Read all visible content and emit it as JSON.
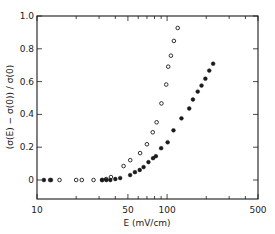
{
  "chart_data": {
    "type": "scatter",
    "title": "",
    "xlabel": "E (mV/cm)",
    "ylabel": "(σ(E) − σ(0)) / σ(0)",
    "xscale": "log",
    "xlim": [
      10,
      500
    ],
    "ylim": [
      -0.11,
      1.0
    ],
    "x_ticks": [
      10,
      50,
      100,
      500
    ],
    "x_tick_labels": [
      "10",
      "50",
      "100",
      "500"
    ],
    "y_ticks": [
      0,
      0.2,
      0.4,
      0.6,
      0.8,
      1.0
    ],
    "y_tick_labels": [
      "0",
      "0.2",
      "0.4",
      "0.6",
      "0.8",
      "1.0"
    ],
    "grid": false,
    "legend": null,
    "series": [
      {
        "name": "open circles",
        "marker": "open-circle",
        "points": [
          [
            12.6,
            0.0
          ],
          [
            14.9,
            0.0
          ],
          [
            20.0,
            0.0
          ],
          [
            22.1,
            0.0
          ],
          [
            27.2,
            0.0
          ],
          [
            31.7,
            0.0
          ],
          [
            34.0,
            0.006
          ],
          [
            37.0,
            0.018
          ],
          [
            46.3,
            0.085
          ],
          [
            52.1,
            0.121
          ],
          [
            62.0,
            0.164
          ],
          [
            70.0,
            0.218
          ],
          [
            77.6,
            0.291
          ],
          [
            83.1,
            0.352
          ],
          [
            90.5,
            0.467
          ],
          [
            98.5,
            0.582
          ],
          [
            102.0,
            0.691
          ],
          [
            107.0,
            0.758
          ],
          [
            112.8,
            0.848
          ],
          [
            120.7,
            0.927
          ]
        ]
      },
      {
        "name": "filled circles",
        "marker": "filled-circle",
        "points": [
          [
            11.3,
            0.0
          ],
          [
            12.8,
            0.0
          ],
          [
            31.6,
            0.0
          ],
          [
            34.1,
            0.0
          ],
          [
            36.6,
            0.0
          ],
          [
            40.0,
            0.006
          ],
          [
            43.6,
            0.012
          ],
          [
            52.0,
            0.03
          ],
          [
            56.6,
            0.048
          ],
          [
            61.6,
            0.061
          ],
          [
            66.0,
            0.079
          ],
          [
            71.9,
            0.109
          ],
          [
            78.0,
            0.133
          ],
          [
            82.0,
            0.145
          ],
          [
            90.0,
            0.194
          ],
          [
            101.0,
            0.23
          ],
          [
            112.0,
            0.303
          ],
          [
            129.0,
            0.376
          ],
          [
            148.0,
            0.436
          ],
          [
            158.0,
            0.491
          ],
          [
            172.0,
            0.539
          ],
          [
            184.0,
            0.576
          ],
          [
            197.0,
            0.618
          ],
          [
            211.0,
            0.667
          ],
          [
            226.0,
            0.709
          ]
        ]
      }
    ]
  },
  "colors": {
    "ink": "#1a1a1a",
    "background": "#ffffff"
  }
}
